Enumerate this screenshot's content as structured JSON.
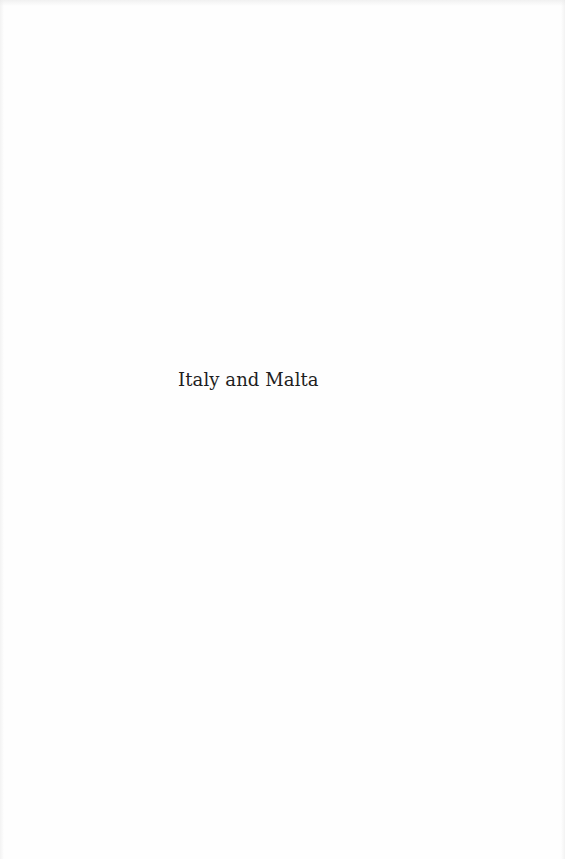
{
  "page": {
    "type": "half-title page",
    "title": "Italy and Malta",
    "background_color": "#fefefe",
    "text_color": "#1e1e1e"
  }
}
